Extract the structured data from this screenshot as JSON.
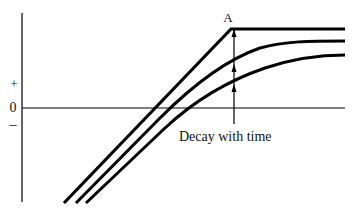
{
  "diagram": {
    "labels": {
      "peak": "A",
      "plus": "+",
      "zero": "0",
      "minus": "–",
      "annotation": "Decay with time"
    },
    "curves": [
      {
        "name": "initial",
        "shape": "linear rise to peak A then flat"
      },
      {
        "name": "decayed-1",
        "shape": "rise then saturating curve"
      },
      {
        "name": "decayed-2",
        "shape": "rise then lower saturating curve"
      }
    ],
    "colors": {
      "line": "#000000",
      "background": "#ffffff"
    }
  }
}
